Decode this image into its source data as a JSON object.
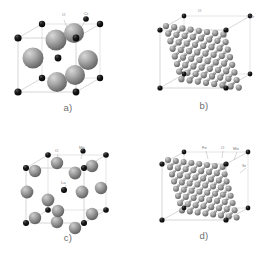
{
  "figure": {
    "background_color": "#ffffff",
    "panel_count": 4
  },
  "palette": {
    "sphere_gray_light": "#b9b9b9",
    "sphere_gray_mid": "#8f8f8f",
    "sphere_gray_dark": "#6b6b6b",
    "sphere_black": "#111111",
    "cell_edge": "#b6b6b6",
    "label_text": "#777777",
    "caption_text": "#6d6d6d"
  },
  "panels": {
    "a": {
      "caption": "a)",
      "name": "perovskite-unit-cell-cro",
      "atom_labels": [
        {
          "text": "O",
          "x": 62,
          "y": 16
        },
        {
          "text": "Cr",
          "x": 84,
          "y": 15
        }
      ],
      "legend_species": [
        "O",
        "Cr"
      ],
      "style": "sparse-unit-cell"
    },
    "b": {
      "caption": "b)",
      "name": "supercell-dense-b",
      "atom_labels": [
        {
          "text": "O",
          "x": 62,
          "y": 12
        },
        {
          "text": "Cr",
          "x": 116,
          "y": 18
        }
      ],
      "legend_species": [
        "O",
        "Cr"
      ],
      "style": "dense-supercell"
    },
    "c": {
      "caption": "c)",
      "name": "perovskite-unit-cell-lamno",
      "atom_labels": [
        {
          "text": "O",
          "x": 56,
          "y": 21
        },
        {
          "text": "Mn",
          "x": 81,
          "y": 18
        },
        {
          "text": "La",
          "x": 64,
          "y": 53
        }
      ],
      "legend_species": [
        "O",
        "Mn",
        "La"
      ],
      "style": "sparse-unit-cell"
    },
    "d": {
      "caption": "d)",
      "name": "double-perovskite-supercell-srfemoo",
      "atom_labels": [
        {
          "text": "Fe",
          "x": 68,
          "y": 18
        },
        {
          "text": "O",
          "x": 86,
          "y": 18
        },
        {
          "text": "Mo",
          "x": 100,
          "y": 19
        },
        {
          "text": "Sr",
          "x": 108,
          "y": 36
        }
      ],
      "legend_species": [
        "Fe",
        "O",
        "Mo",
        "Sr"
      ],
      "style": "dense-supercell"
    }
  }
}
